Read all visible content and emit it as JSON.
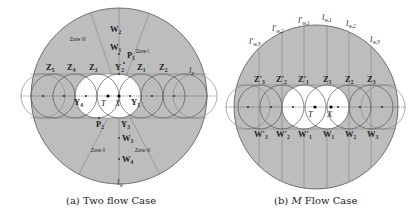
{
  "panel_a": {
    "caption": "(a) Two flow Case",
    "zones": {
      "zone1": "Zone I",
      "zone2": "Zone II",
      "zone3": "Zone III",
      "zone4": "Zone IV"
    },
    "labels": {
      "W2": "W",
      "W2_sub": "2",
      "W1": "W",
      "W1_sub": "1",
      "P1": "P",
      "P1_sub": "1",
      "P2": "P",
      "P2_sub": "2",
      "Y1": "Y",
      "Y1_sub": "1",
      "Y2": "Y",
      "Y2_sub": "2",
      "Y3": "Y",
      "Y3_sub": "3",
      "Y4": "Y",
      "Y4_sub": "4",
      "Z1": "Z",
      "Z1_sub": "1",
      "Z2": "Z",
      "Z2_sub": "2",
      "Z3": "Z",
      "Z3_sub": "3",
      "Z4": "Z",
      "Z4_sub": "4",
      "Z5": "Z",
      "Z5_sub": "5",
      "W3": "W",
      "W3_sub": "3",
      "W4": "W",
      "W4_sub": "4",
      "T": "T",
      "X": "X",
      "lz": "l",
      "lz_sub": "z",
      "lw": "l",
      "lw_sub": "w"
    }
  },
  "panel_b": {
    "caption_prefix": "(b) ",
    "caption_italic": "M",
    "caption_suffix": " Flow Case",
    "labels": {
      "lpw3": "l'",
      "lpw3_sub": "w,3",
      "lpw2": "l'",
      "lpw2_sub": "w,2",
      "lpw1": "l'",
      "lpw1_sub": "w,1",
      "lw1": "l",
      "lw1_sub": "w,1",
      "lw2": "l",
      "lw2_sub": "w,2",
      "lw3": "l",
      "lw3_sub": "w,3",
      "Zp3": "Z'",
      "Zp3_sub": "3",
      "Zp2": "Z'",
      "Zp2_sub": "2",
      "Zp1": "Z'",
      "Zp1_sub": "1",
      "Z1": "Z",
      "Z1_sub": "1",
      "Z2": "Z",
      "Z2_sub": "2",
      "Z3": "Z",
      "Z3_sub": "3",
      "Wp3": "W'",
      "Wp3_sub": "3",
      "Wp2": "W'",
      "Wp2_sub": "2",
      "Wp1": "W'",
      "Wp1_sub": "1",
      "W1": "W",
      "W1_sub": "1",
      "W2": "W",
      "W2_sub": "2",
      "W3": "W",
      "W3_sub": "3",
      "T": "T",
      "X": "X"
    }
  },
  "colors": {
    "fill_gray": "#bdbdbd",
    "stroke": "#555555",
    "white_region": "#ffffff"
  }
}
